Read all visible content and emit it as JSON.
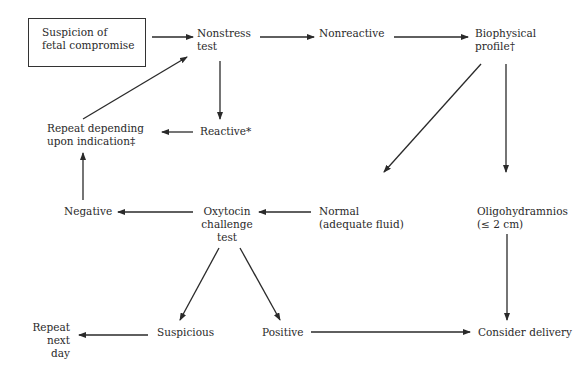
{
  "diagram": {
    "type": "flowchart",
    "colors": {
      "line": "#2a2a2a",
      "text": "#2a2a2a",
      "background": "#ffffff"
    },
    "nodes": {
      "suspicion": {
        "lines": [
          "Suspicion of",
          "fetal compromise"
        ]
      },
      "nst": {
        "lines": [
          "Nonstress",
          "test"
        ]
      },
      "nonreactive": {
        "lines": [
          "Nonreactive"
        ]
      },
      "bpp": {
        "lines": [
          "Biophysical",
          "profile†"
        ]
      },
      "repeat_indication": {
        "lines": [
          "Repeat depending",
          "upon indication‡"
        ]
      },
      "reactive": {
        "lines": [
          "Reactive*"
        ]
      },
      "negative": {
        "lines": [
          "Negative"
        ]
      },
      "oct": {
        "lines": [
          "Oxytocin",
          "challenge",
          "test"
        ]
      },
      "normal": {
        "lines": [
          "Normal",
          "(adequate fluid)"
        ]
      },
      "oligo": {
        "lines": [
          "Oligohydramnios",
          "(≤ 2 cm)"
        ]
      },
      "repeat_next_day": {
        "lines": [
          "Repeat",
          "next",
          "day"
        ]
      },
      "suspicious": {
        "lines": [
          "Suspicious"
        ]
      },
      "positive": {
        "lines": [
          "Positive"
        ]
      },
      "delivery": {
        "lines": [
          "Consider delivery"
        ]
      }
    },
    "edges": [
      {
        "from": "suspicion",
        "to": "nst"
      },
      {
        "from": "nst",
        "to": "nonreactive"
      },
      {
        "from": "nonreactive",
        "to": "bpp"
      },
      {
        "from": "nst",
        "to": "reactive"
      },
      {
        "from": "reactive",
        "to": "repeat_indication"
      },
      {
        "from": "repeat_indication",
        "to": "nst"
      },
      {
        "from": "bpp",
        "to": "normal"
      },
      {
        "from": "bpp",
        "to": "oligo"
      },
      {
        "from": "normal",
        "to": "oct"
      },
      {
        "from": "oct",
        "to": "negative"
      },
      {
        "from": "negative",
        "to": "repeat_indication"
      },
      {
        "from": "oct",
        "to": "suspicious"
      },
      {
        "from": "oct",
        "to": "positive"
      },
      {
        "from": "suspicious",
        "to": "repeat_next_day"
      },
      {
        "from": "positive",
        "to": "delivery"
      },
      {
        "from": "oligo",
        "to": "delivery"
      }
    ]
  }
}
